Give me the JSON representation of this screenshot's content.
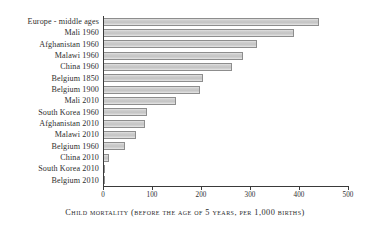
{
  "chart": {
    "caption": "Child mortality (before the age of 5 years, per 1,000 births)"
  },
  "chart_data": {
    "type": "bar",
    "orientation": "horizontal",
    "title": "",
    "subtitle": "",
    "xlabel": "Child mortality (before the age of 5 years, per 1,000 births)",
    "ylabel": "",
    "xlim": [
      0,
      500
    ],
    "ylim": null,
    "grid": false,
    "legend": null,
    "xticks": [
      0,
      100,
      200,
      300,
      400,
      500
    ],
    "xtick_labels": [
      "0",
      "100",
      "200",
      "300",
      "400",
      "500"
    ],
    "categories": [
      "Europe - middle ages",
      "Mali 1960",
      "Afghanistan 1960",
      "Malawi 1960",
      "China 1960",
      "Belgium 1850",
      "Belgium 1900",
      "Mali 2010",
      "South Korea 1960",
      "Afghanistan 2010",
      "Malawi 2010",
      "Belgium 1960",
      "China 2010",
      "South Korea 2010",
      "Belgium 2010"
    ],
    "values": [
      440,
      390,
      315,
      285,
      263,
      205,
      198,
      148,
      90,
      86,
      67,
      45,
      12,
      4,
      4
    ],
    "bar_color": "#cdcdcd",
    "bar_edge_color": "#8d8d8d",
    "axis_color": "#3a3a3a"
  }
}
